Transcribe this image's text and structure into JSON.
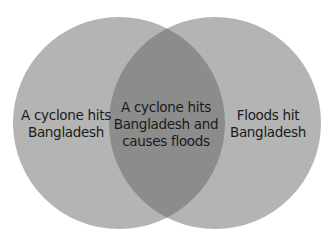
{
  "diagram": {
    "type": "venn",
    "colors": {
      "circle_fill": "#b4b4b4",
      "overlap_fill": "#8c8c8c",
      "text": "#1a1a1a",
      "background": "#ffffff"
    },
    "sets": [
      {
        "id": "left",
        "lines": [
          "A cyclone hits",
          "Bangladesh"
        ]
      },
      {
        "id": "right",
        "lines": [
          "Floods hit",
          "Bangladesh"
        ]
      }
    ],
    "intersection": {
      "lines": [
        "A cyclone hits",
        "Bangladesh and",
        "causes floods"
      ]
    }
  }
}
